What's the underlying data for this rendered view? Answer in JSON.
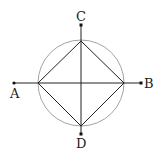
{
  "diagram": {
    "type": "geometry",
    "labels": {
      "A": "A",
      "B": "B",
      "C": "C",
      "D": "D"
    },
    "colors": {
      "circle": "#999999",
      "lines": "#222222",
      "points": "#111111"
    }
  }
}
